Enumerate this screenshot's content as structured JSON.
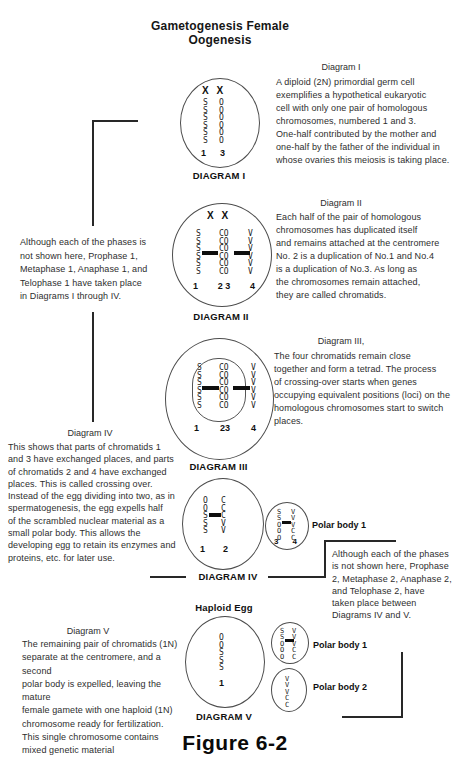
{
  "title": {
    "line1": "Gametogenesis Female",
    "line2": "Oogenesis"
  },
  "diagram1": {
    "heading": "Diagram I",
    "description": "A diploid (2N) primordial germ cell\nexemplifies a hypothetical eukaryotic\ncell with only one pair of homologous\nchromosomes, numbered 1 and 3.\nOne-half contributed by the mother and\none-half by the father of the individual in\nwhose ovaries this meiosis is taking place.",
    "label": "DIAGRAM I",
    "cell": {
      "header": "X X",
      "col1": "SSSSSS",
      "col2": "OOOOOO",
      "nums": [
        "1",
        "3"
      ]
    }
  },
  "left_note": "Although each of the phases is\nnot shown here, Prophase 1,\nMetaphase 1, Anaphase 1, and\nTelophase 1 have taken place\nin Diagrams I through IV.",
  "diagram2": {
    "heading": "Diagram II",
    "description": "Each half of the pair of homologous\nchromosomes has duplicated itself\nand remains attached at the centromere\nNo. 2 is a duplication of No.1 and No.4\nis a duplication of No.3.  As long as\nthe chromosomes remain attached,\nthey are called chromatids.",
    "label": "DIAGRAM II",
    "cell": {
      "header": "X X",
      "col1": "SSSSSS",
      "col23": "COCOCOCOCOCO",
      "col4": "VVVVVV",
      "nums": [
        "1",
        "2 3",
        "4"
      ]
    }
  },
  "diagram3": {
    "heading": "Diagram III,",
    "description": "The four chromatids remain close\ntogether and form a tetrad.  The process\nof crossing-over starts when genes\noccupying equivalent positions (loci) on the\nhomologous chromosomes start to switch\nplaces.",
    "label": "DIAGRAM III",
    "cell": {
      "col1": "SSSSSS",
      "col23": "COCOCOCOCOCO",
      "col4": "VVVVVV",
      "nums": [
        "1",
        "23",
        "4"
      ]
    }
  },
  "diagram4": {
    "heading": "Diagram IV",
    "description": "This shows that parts of chromatids 1\nand 3 have exchanged places, and parts\nof chromatids 2 and 4 have exchanged\nplaces.  This is called crossing over.\nInstead of the egg dividing into two, as in\nspermatogenesis, the egg expells half\nof the scrambled nuclear material as a\nsmall polar body.  This allows the\ndeveloping egg to retain its enzymes and\nproteins, etc. for later use.",
    "label": "DIAGRAM IV",
    "egg": {
      "col1": "OOSSS",
      "col2": "CCCVV",
      "nums": [
        "1",
        "2"
      ]
    },
    "polar": {
      "col3": "SSOOO",
      "col4": "VVVCC",
      "nums": [
        "3",
        "4"
      ],
      "label": "Polar body 1"
    }
  },
  "right_note": "Although each of the phases\nis not shown here, Prophase\n2, Metaphase 2, Anaphase 2,\nand Telophase 2,  have\ntaken place between\nDiagrams IV and V.",
  "diagram5": {
    "egg_title": "Haploid Egg",
    "heading": "Diagram V",
    "description": "The remaining pair of chromatids (1N)\nseparate at the centromere, and a second\npolar body is expelled, leaving the mature\nfemale gamete with one haploid (1N)\nchromosome ready for fertilization.\nThis single chromosome contains\nmixed genetic material",
    "label": "DIAGRAM V",
    "egg": {
      "col1": "OOSSS",
      "num": "1"
    },
    "polar1": {
      "colL": "SSOOO",
      "colR": "VVVCC",
      "label": "Polar body 1"
    },
    "polar2": {
      "col": "VVVCC",
      "label": "Polar body 2"
    }
  },
  "figure_label": "Figure 6-2"
}
